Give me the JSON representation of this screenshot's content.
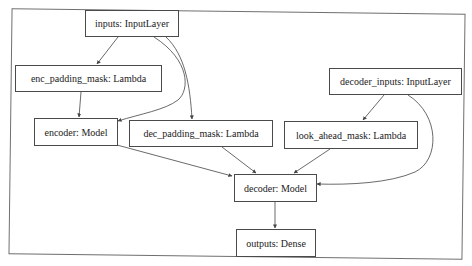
{
  "diagram": {
    "type": "model-graph",
    "colors": {
      "border": "#4a4a4a",
      "edge": "#444444",
      "frame": "#6f6f6f",
      "background": "#ffffff"
    },
    "nodes": [
      {
        "id": "inputs",
        "label": "inputs: InputLayer"
      },
      {
        "id": "enc_padding_mask",
        "label": "enc_padding_mask: Lambda"
      },
      {
        "id": "encoder",
        "label": "encoder: Model"
      },
      {
        "id": "dec_padding_mask",
        "label": "dec_padding_mask: Lambda"
      },
      {
        "id": "decoder_inputs",
        "label": "decoder_inputs: InputLayer"
      },
      {
        "id": "look_ahead_mask",
        "label": "look_ahead_mask: Lambda"
      },
      {
        "id": "decoder",
        "label": "decoder: Model"
      },
      {
        "id": "outputs",
        "label": "outputs: Dense"
      }
    ],
    "edges": [
      {
        "from": "inputs",
        "to": "enc_padding_mask"
      },
      {
        "from": "inputs",
        "to": "encoder"
      },
      {
        "from": "inputs",
        "to": "dec_padding_mask"
      },
      {
        "from": "enc_padding_mask",
        "to": "encoder"
      },
      {
        "from": "decoder_inputs",
        "to": "look_ahead_mask"
      },
      {
        "from": "decoder_inputs",
        "to": "decoder"
      },
      {
        "from": "encoder",
        "to": "decoder"
      },
      {
        "from": "dec_padding_mask",
        "to": "decoder"
      },
      {
        "from": "look_ahead_mask",
        "to": "decoder"
      },
      {
        "from": "decoder",
        "to": "outputs"
      }
    ]
  }
}
